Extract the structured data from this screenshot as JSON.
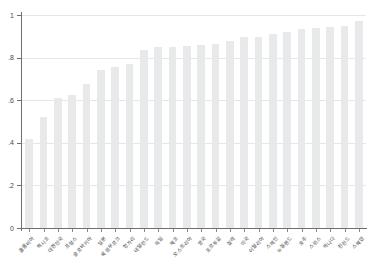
{
  "chart_data": {
    "type": "bar",
    "title": "",
    "subtitle": "",
    "xlabel": "",
    "ylabel": "",
    "ylim": [
      0,
      1
    ],
    "ytick_labels": [
      "0",
      ".2",
      ".4",
      ".6",
      ".8",
      "1"
    ],
    "ytick_values": [
      0,
      0.2,
      0.4,
      0.6,
      0.8,
      1
    ],
    "grid": true,
    "legend": false,
    "legend_position": "none",
    "bar_color": "#e7e9ea",
    "axis_color": "#6f6f6f",
    "grid_color": "#e6e6e6",
    "categories": [
      "콜롬비아",
      "멕시코",
      "대한민국",
      "프랑스",
      "슬로바키아",
      "일본",
      "룩셈부르크",
      "헝가리",
      "네덜란드",
      "독일",
      "체코",
      "오스트리아",
      "영국",
      "포르투갈",
      "칠레",
      "미국",
      "이탈리아",
      "스페인",
      "뉴질랜드",
      "호주",
      "스위스",
      "캐나다",
      "핀란드",
      "스웨덴"
    ],
    "values": [
      0.42,
      0.52,
      0.61,
      0.625,
      0.675,
      0.74,
      0.755,
      0.77,
      0.835,
      0.85,
      0.85,
      0.855,
      0.86,
      0.865,
      0.88,
      0.895,
      0.895,
      0.91,
      0.92,
      0.935,
      0.94,
      0.945,
      0.95,
      0.97
    ]
  }
}
